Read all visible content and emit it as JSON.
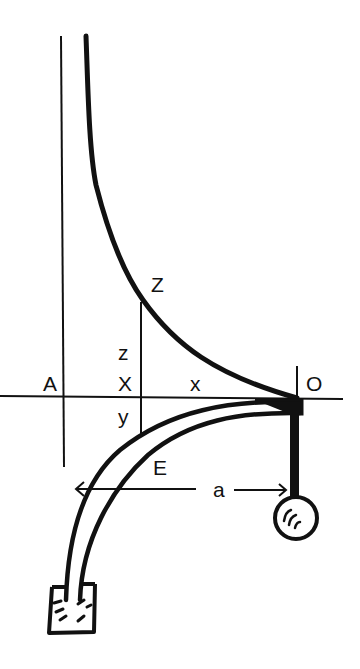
{
  "diagram": {
    "type": "hand-drawn physics sketch (tractrix / siphon-capillary)",
    "colors": {
      "ink": "#111111",
      "background": "#ffffff"
    },
    "labels": {
      "A": "A",
      "X_upper": "X",
      "x_lower": "x",
      "Z": "Z",
      "z": "z",
      "y": "y",
      "O": "O",
      "E": "E",
      "a": "a"
    },
    "elements": [
      {
        "id": "vertical-asymptote-line",
        "desc": "thin vertical line through A"
      },
      {
        "id": "horizontal-axis",
        "desc": "thin horizontal line through A, X, O"
      },
      {
        "id": "upper-curve",
        "desc": "thick curve from top descending to O (tractrix-like)"
      },
      {
        "id": "ordinate-line",
        "desc": "thin vertical line from Z down through X to lower tube"
      },
      {
        "id": "tube",
        "desc": "double-walled curved tube from O down-left into a container"
      },
      {
        "id": "stem",
        "desc": "thick vertical stem from O down to bulb"
      },
      {
        "id": "bulb",
        "desc": "circle with shading marks at bottom of stem"
      },
      {
        "id": "container",
        "desc": "small square vessel with hatch marks at tube end"
      },
      {
        "id": "dimension-arrow-a",
        "desc": "double-headed horizontal arrow labeled a"
      }
    ]
  }
}
